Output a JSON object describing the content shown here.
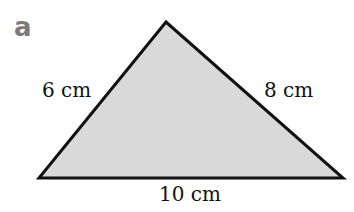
{
  "part_label": "a",
  "triangle": {
    "vertices": {
      "apex": [
        166,
        22
      ],
      "bottom_left": [
        39,
        178
      ],
      "bottom_right": [
        343,
        178
      ]
    },
    "fill": "#d9d9d9",
    "stroke": "#111111"
  },
  "sides": {
    "left": "6 cm",
    "right": "8 cm",
    "bottom": "10 cm"
  }
}
